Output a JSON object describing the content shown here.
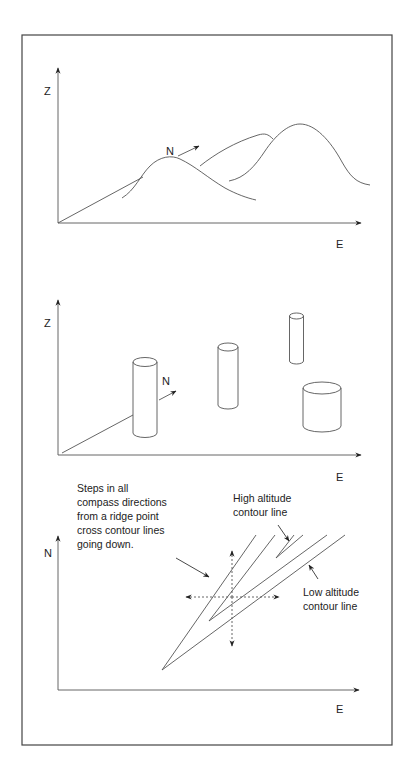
{
  "figure": {
    "panel_top": {
      "y_axis_label": "Z",
      "x_axis_label": "E",
      "depth_axis_label": "N",
      "description": "Smooth terrain surface with overlapping hills"
    },
    "panel_middle": {
      "y_axis_label": "Z",
      "x_axis_label": "E",
      "depth_axis_label": "N",
      "description": "Terrain approximated by isolated cylinders"
    },
    "panel_bottom": {
      "y_axis_label": "N",
      "x_axis_label": "E",
      "annotation_steps": [
        "Steps in all",
        "compass directions",
        "from a ridge point",
        "cross contour lines",
        "going down."
      ],
      "annotation_high": [
        "High altitude",
        "contour line"
      ],
      "annotation_low": [
        "Low altitude",
        "contour line"
      ]
    }
  },
  "colors": {
    "line": "#555555",
    "frame": "#444444",
    "text": "#222222",
    "background": "#ffffff"
  }
}
